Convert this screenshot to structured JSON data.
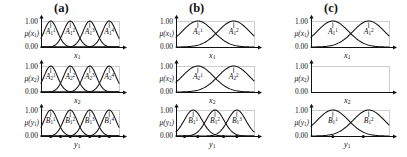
{
  "figure": {
    "panels": [
      {
        "id": "a",
        "label": "(a)",
        "rows": [
          {
            "id": "a-row1",
            "yticks": [
              "1.00",
              "0.00"
            ],
            "ylabel": "μ(x₁)",
            "ylabel_base": "μ(x",
            "ylabel_sub": "1",
            "xlabel_base": "x",
            "xlabel_sub": "1",
            "sets": [
              {
                "label_base": "A",
                "sub": "1",
                "sup": "1",
                "center": 0.125
              },
              {
                "label_base": "A",
                "sub": "1",
                "sup": "2",
                "center": 0.375
              },
              {
                "label_base": "A",
                "sub": "1",
                "sup": "3",
                "center": 0.625
              },
              {
                "label_base": "A",
                "sub": "1",
                "sup": "4",
                "center": 0.875
              }
            ],
            "dots": []
          },
          {
            "id": "a-row2",
            "yticks": [
              "1.00",
              "0.00"
            ],
            "ylabel_base": "μ(x",
            "ylabel_sub": "2",
            "xlabel_base": "x",
            "xlabel_sub": "2",
            "sets": [
              {
                "label_base": "A",
                "sub": "2",
                "sup": "1",
                "center": 0.125
              },
              {
                "label_base": "A",
                "sub": "2",
                "sup": "2",
                "center": 0.375
              },
              {
                "label_base": "A",
                "sub": "2",
                "sup": "3",
                "center": 0.625
              },
              {
                "label_base": "A",
                "sub": "2",
                "sup": "4",
                "center": 0.875
              }
            ],
            "dots": []
          },
          {
            "id": "a-row3",
            "yticks": [
              "1.00",
              "0.00"
            ],
            "ylabel_base": "μ(y",
            "ylabel_sub": "1",
            "xlabel_base": "y",
            "xlabel_sub": "1",
            "sets": [
              {
                "label_base": "B",
                "sub": "1",
                "sup": "1",
                "center": 0.125
              },
              {
                "label_base": "B",
                "sub": "1",
                "sup": "2",
                "center": 0.375
              },
              {
                "label_base": "B",
                "sub": "1",
                "sup": "3",
                "center": 0.625
              },
              {
                "label_base": "B",
                "sub": "1",
                "sup": "4",
                "center": 0.875
              }
            ],
            "dots": [
              0.125,
              0.25,
              0.375,
              0.5,
              0.625,
              0.75,
              0.875
            ]
          }
        ]
      },
      {
        "id": "b",
        "label": "(b)",
        "rows": [
          {
            "id": "b-row1",
            "yticks": [
              "1.00",
              "0.00"
            ],
            "ylabel_base": "μ(x",
            "ylabel_sub": "1",
            "xlabel_base": "x",
            "xlabel_sub": "1",
            "sets": [
              {
                "label_base": "A",
                "sub": "1",
                "sup": "1",
                "center": 0.28
              },
              {
                "label_base": "A",
                "sub": "1",
                "sup": "2",
                "center": 0.74
              }
            ],
            "dots": []
          },
          {
            "id": "b-row2",
            "yticks": [
              "1.00",
              "0.00"
            ],
            "ylabel_base": "μ(x",
            "ylabel_sub": "2",
            "xlabel_base": "x",
            "xlabel_sub": "2",
            "sets": [
              {
                "label_base": "A",
                "sub": "2",
                "sup": "1",
                "center": 0.28
              },
              {
                "label_base": "A",
                "sub": "2",
                "sup": "2",
                "center": 0.74
              }
            ],
            "dots": []
          },
          {
            "id": "b-row3",
            "yticks": [
              "1.00",
              "0.00"
            ],
            "ylabel_base": "μ(y",
            "ylabel_sub": "1",
            "xlabel_base": "y",
            "xlabel_sub": "1",
            "sets": [
              {
                "label_base": "B",
                "sub": "1",
                "sup": "1",
                "center": 0.22
              },
              {
                "label_base": "B",
                "sub": "1",
                "sup": "2",
                "center": 0.5
              },
              {
                "label_base": "B",
                "sub": "1",
                "sup": "3",
                "center": 0.78
              }
            ],
            "dots": [
              0.11,
              0.28,
              0.61,
              0.78
            ]
          }
        ]
      },
      {
        "id": "c",
        "label": "(c)",
        "rows": [
          {
            "id": "c-row1",
            "yticks": [
              "1.00",
              "0.00"
            ],
            "ylabel_base": "μ(x",
            "ylabel_sub": "1",
            "xlabel_base": "x",
            "xlabel_sub": "1",
            "sets": [
              {
                "label_base": "A",
                "sub": "1",
                "sup": "1",
                "center": 0.28
              },
              {
                "label_base": "A",
                "sub": "1",
                "sup": "2",
                "center": 0.74
              }
            ],
            "dots": []
          },
          {
            "id": "c-row2",
            "yticks": [
              "1.00",
              "0.00"
            ],
            "ylabel_base": "μ(x",
            "ylabel_sub": "2",
            "xlabel_base": "x",
            "xlabel_sub": "2",
            "sets": [],
            "dots": []
          },
          {
            "id": "c-row3",
            "yticks": [
              "1.00",
              "0.00"
            ],
            "ylabel_base": "μ(y",
            "ylabel_sub": "1",
            "xlabel_base": "y",
            "xlabel_sub": "1",
            "sets": [
              {
                "label_base": "B",
                "sub": "1",
                "sup": "1",
                "center": 0.28
              },
              {
                "label_base": "B",
                "sub": "1",
                "sup": "2",
                "center": 0.74
              }
            ],
            "dots": [
              0.28,
              0.67
            ]
          }
        ]
      }
    ]
  },
  "chart_data": {
    "type": "line",
    "title": "",
    "xlabel": "",
    "ylabel": "",
    "ylim": [
      0.0,
      1.0
    ],
    "yticks": [
      0.0,
      1.0
    ],
    "ytick_labels": [
      "0.00",
      "1.00"
    ],
    "grid": false,
    "legend_position": "none",
    "panels": [
      {
        "panel": "(a)",
        "rows": [
          {
            "variable": "x1",
            "ylabel": "mu(x1)",
            "n_sets": 4,
            "set_labels": [
              "A_1^1",
              "A_1^2",
              "A_1^3",
              "A_1^4"
            ],
            "centers": [
              0.125,
              0.375,
              0.625,
              0.875
            ],
            "sigma": 0.085,
            "peak": 1.0,
            "dots": []
          },
          {
            "variable": "x2",
            "ylabel": "mu(x2)",
            "n_sets": 4,
            "set_labels": [
              "A_2^1",
              "A_2^2",
              "A_2^3",
              "A_2^4"
            ],
            "centers": [
              0.125,
              0.375,
              0.625,
              0.875
            ],
            "sigma": 0.085,
            "peak": 1.0,
            "dots": []
          },
          {
            "variable": "y1",
            "ylabel": "mu(y1)",
            "n_sets": 4,
            "set_labels": [
              "B_1^1",
              "B_1^2",
              "B_1^3",
              "B_1^4"
            ],
            "centers": [
              0.125,
              0.375,
              0.625,
              0.875
            ],
            "sigma": 0.085,
            "peak": 1.0,
            "dots": [
              0.125,
              0.25,
              0.375,
              0.5,
              0.625,
              0.75,
              0.875
            ]
          }
        ]
      },
      {
        "panel": "(b)",
        "rows": [
          {
            "variable": "x1",
            "ylabel": "mu(x1)",
            "n_sets": 2,
            "set_labels": [
              "A_1^1",
              "A_1^2"
            ],
            "centers": [
              0.28,
              0.74
            ],
            "sigma": 0.2,
            "peak": 1.0,
            "dots": []
          },
          {
            "variable": "x2",
            "ylabel": "mu(x2)",
            "n_sets": 2,
            "set_labels": [
              "A_2^1",
              "A_2^2"
            ],
            "centers": [
              0.28,
              0.74
            ],
            "sigma": 0.2,
            "peak": 1.0,
            "dots": []
          },
          {
            "variable": "y1",
            "ylabel": "mu(y1)",
            "n_sets": 3,
            "set_labels": [
              "B_1^1",
              "B_1^2",
              "B_1^3"
            ],
            "centers": [
              0.22,
              0.5,
              0.78
            ],
            "sigma": 0.115,
            "peak": 1.0,
            "dots": [
              0.11,
              0.28,
              0.61,
              0.78
            ]
          }
        ]
      },
      {
        "panel": "(c)",
        "rows": [
          {
            "variable": "x1",
            "ylabel": "mu(x1)",
            "n_sets": 2,
            "set_labels": [
              "A_1^1",
              "A_1^2"
            ],
            "centers": [
              0.28,
              0.74
            ],
            "sigma": 0.2,
            "peak": 1.0,
            "dots": []
          },
          {
            "variable": "x2",
            "ylabel": "mu(x2)",
            "n_sets": 0,
            "set_labels": [],
            "centers": [],
            "sigma": 0.0,
            "peak": 0.0,
            "dots": []
          },
          {
            "variable": "y1",
            "ylabel": "mu(y1)",
            "n_sets": 2,
            "set_labels": [
              "B_1^1",
              "B_1^2"
            ],
            "centers": [
              0.28,
              0.74
            ],
            "sigma": 0.2,
            "peak": 1.0,
            "dots": [
              0.28,
              0.67
            ]
          }
        ]
      }
    ]
  }
}
